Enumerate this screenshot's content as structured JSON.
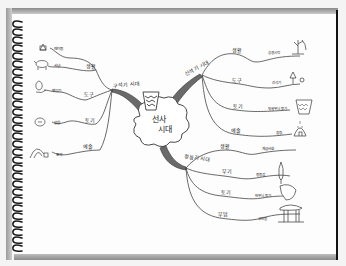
{
  "image": {
    "kind": "hand-drawn mind map in spiral notebook",
    "ink_color": "#2a2a2a",
    "page_color": "#fdfdfd"
  },
  "center": {
    "label": "선사 시대",
    "icon": "pot-icon"
  },
  "branches": [
    {
      "id": "paleolithic",
      "label": "구석기 시대",
      "children": [
        {
          "label": "생활",
          "leaves": [
            {
              "label": "떼이동",
              "icon": "hut-icon"
            },
            {
              "label": "사냥",
              "icon": "animal-icon"
            }
          ]
        },
        {
          "label": "도구",
          "leaves": [
            {
              "label": "뗀석기",
              "icon": "stone-tool-icon"
            }
          ]
        },
        {
          "label": "토기",
          "leaves": [
            {
              "label": "없음",
              "icon": "fire-icon"
            }
          ]
        },
        {
          "label": "예술",
          "leaves": [
            {
              "label": "조각",
              "icon": "cave-icon"
            }
          ]
        }
      ]
    },
    {
      "id": "neolithic",
      "label": "신석기 시대",
      "children": [
        {
          "label": "생활",
          "leaves": [
            {
              "label": "농경시작",
              "icon": "plant-icon"
            }
          ]
        },
        {
          "label": "도구",
          "leaves": [
            {
              "label": "간석기",
              "icon": "tool-icon"
            }
          ]
        },
        {
          "label": "토기",
          "leaves": [
            {
              "label": "빗살무늬 토기",
              "icon": "comb-pottery-icon"
            }
          ]
        },
        {
          "label": "예술",
          "leaves": [
            {
              "label": "움집",
              "icon": "dwelling-icon"
            }
          ]
        }
      ]
    },
    {
      "id": "bronze",
      "label": "청동기 시대",
      "children": [
        {
          "label": "생활",
          "leaves": [
            {
              "label": "계급사회",
              "icon": ""
            }
          ]
        },
        {
          "label": "무기",
          "leaves": [
            {
              "label": "청동검",
              "icon": "dagger-icon"
            }
          ]
        },
        {
          "label": "토기",
          "leaves": [
            {
              "label": "민무늬 토기",
              "icon": "plain-pottery-icon"
            }
          ]
        },
        {
          "label": "무덤",
          "leaves": [
            {
              "label": "고인돌",
              "icon": "dolmen-icon"
            }
          ]
        }
      ]
    }
  ]
}
